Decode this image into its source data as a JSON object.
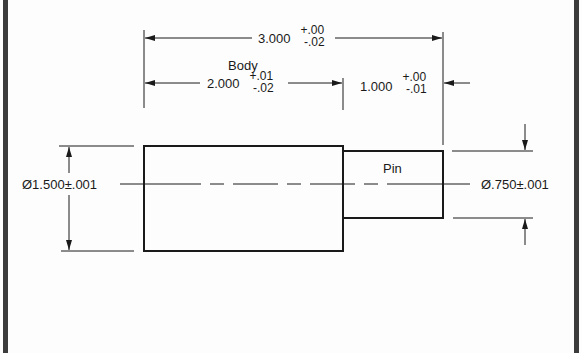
{
  "drawing": {
    "type": "engineering-dimension-drawing",
    "parts": [
      {
        "name": "Body",
        "label": "Body"
      },
      {
        "name": "Pin",
        "label": "Pin"
      }
    ],
    "dimensions": {
      "overall_length": {
        "nominal": "3.000",
        "tol_upper": "+.00",
        "tol_lower": "-.02"
      },
      "body_length": {
        "nominal": "2.000",
        "tol_upper": "+.01",
        "tol_lower": "-.02"
      },
      "pin_length": {
        "nominal": "1.000",
        "tol_upper": "+.00",
        "tol_lower": "-.01"
      },
      "body_diameter": {
        "text": "Ø1.500±.001"
      },
      "pin_diameter": {
        "text": "Ø.750±.001"
      }
    },
    "colors": {
      "line": "#1a1a1a",
      "border": "#3c3c3c",
      "background": "#fdfdfd"
    }
  }
}
